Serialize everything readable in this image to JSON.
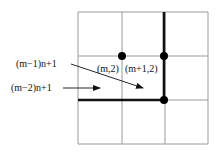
{
  "diagram": {
    "colors": {
      "grid": "#9a9a9a",
      "thick": "#111111",
      "dot": "#000000",
      "text": "#111111"
    },
    "grid": {
      "x": [
        78,
        122,
        165,
        208
      ],
      "y": [
        12,
        56,
        100,
        144
      ]
    },
    "thick_lines": [
      {
        "x1": 164,
        "y1": 12,
        "x2": 164,
        "y2": 100
      },
      {
        "x1": 78,
        "y1": 100,
        "x2": 164,
        "y2": 100
      }
    ],
    "dots": [
      {
        "cx": 122,
        "cy": 56
      },
      {
        "cx": 164,
        "cy": 56
      },
      {
        "cx": 164,
        "cy": 100
      }
    ],
    "labels": {
      "m_minus_1": "(m−1)n+1",
      "m_minus_2": "(m−2)n+1",
      "m_2": "(m,2)",
      "m_plus_1_2": "(m+1,2)"
    }
  }
}
